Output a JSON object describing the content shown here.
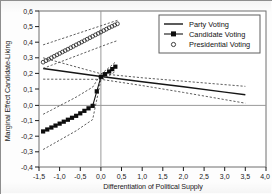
{
  "chart_data": {
    "type": "line",
    "title": "",
    "xlabel": "Differentiation of Political Supply",
    "ylabel": "Marginal Effect Candidate-Liking",
    "xlim": [
      -1.5,
      4.0
    ],
    "ylim": [
      -0.4,
      0.6
    ],
    "xticks": [
      "-1,5",
      "-1,0",
      "-0,5",
      "0,0",
      "0,5",
      "1,0",
      "1,5",
      "2,0",
      "2,5",
      "3,0",
      "3,5",
      "4,0"
    ],
    "xtick_values": [
      -1.5,
      -1.0,
      -0.5,
      0.0,
      0.5,
      1.0,
      1.5,
      2.0,
      2.5,
      3.0,
      3.5,
      4.0
    ],
    "yticks": [
      "-0,4",
      "-0,3",
      "-0,2",
      "-0,1",
      "0,0",
      "0,1",
      "0,2",
      "0,3",
      "0,4",
      "0,5",
      "0,6"
    ],
    "ytick_values": [
      -0.4,
      -0.3,
      -0.2,
      -0.1,
      0.0,
      0.1,
      0.2,
      0.3,
      0.4,
      0.5,
      0.6
    ],
    "grid": false,
    "zero_line_y": 0.0,
    "zero_line_x": 0.0,
    "legend_position": "top-right",
    "legend": [
      "Party Voting",
      "Candidate Voting",
      "Presidential Voting"
    ],
    "series": [
      {
        "name": "Party Voting",
        "style": "solid-line",
        "x": [
          -1.4,
          0.0,
          1.0,
          2.0,
          3.0,
          3.5
        ],
        "values": [
          0.232,
          0.18,
          0.147,
          0.114,
          0.08,
          0.063
        ],
        "ci_upper": [
          0.3,
          0.198,
          0.172,
          0.15,
          0.128,
          0.117
        ],
        "ci_lower": [
          0.163,
          0.162,
          0.122,
          0.078,
          0.032,
          0.009
        ]
      },
      {
        "name": "Candidate Voting",
        "style": "line-with-filled-markers",
        "x": [
          -1.4,
          -1.2,
          -1.0,
          -0.8,
          -0.6,
          -0.4,
          -0.2,
          0.0,
          0.2,
          0.35
        ],
        "values": [
          -0.172,
          -0.147,
          -0.122,
          -0.097,
          -0.072,
          -0.04,
          -0.008,
          0.178,
          0.212,
          0.243
        ],
        "ci_upper": [
          -0.062,
          -0.035,
          -0.007,
          0.02,
          0.048,
          0.08,
          0.112,
          0.195,
          0.238,
          0.272
        ],
        "ci_lower": [
          -0.288,
          -0.258,
          -0.228,
          -0.198,
          -0.168,
          -0.132,
          -0.096,
          0.16,
          0.186,
          0.212
        ]
      },
      {
        "name": "Presidential Voting",
        "style": "open-circle-markers",
        "x": [
          -1.4,
          -1.2,
          -1.0,
          -0.8,
          -0.6,
          -0.4,
          -0.2,
          0.0,
          0.2,
          0.4
        ],
        "values": [
          0.272,
          0.3,
          0.328,
          0.355,
          0.383,
          0.41,
          0.438,
          0.465,
          0.493,
          0.518
        ],
        "ci_upper": [
          0.383,
          0.4,
          0.418,
          0.435,
          0.453,
          0.47,
          0.488,
          0.505,
          0.523,
          0.54
        ],
        "ci_lower": [
          0.232,
          0.252,
          0.272,
          0.292,
          0.312,
          0.332,
          0.352,
          0.372,
          0.392,
          0.41
        ]
      }
    ]
  },
  "axis": {
    "x_title": "Differentiation of Political Supply",
    "y_title": "Marginal Effect Candidate-Liking"
  },
  "legend": {
    "party": "Party Voting",
    "candidate": "Candidate Voting",
    "presidential": "Presidential Voting"
  },
  "colors": {
    "line": "#151515",
    "ci": "#4a4a4a",
    "axis": "#1b1b1b",
    "frame": "#6f6f6f",
    "zero": "#9a9a9a",
    "background": "#fdfdfd"
  }
}
